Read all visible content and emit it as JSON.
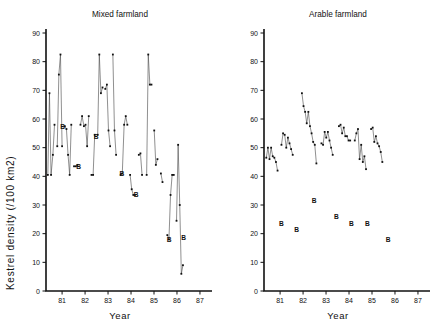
{
  "figure": {
    "y_axis_label": "Kestrel density (/100 km2)",
    "x_axis_label": "Year",
    "y_ticks": [
      "0",
      "10",
      "20",
      "30",
      "40",
      "50",
      "60",
      "70",
      "80",
      "90"
    ],
    "x_ticks": [
      "81",
      "82",
      "83",
      "84",
      "85",
      "86",
      "87"
    ],
    "b_marker_label": "B"
  },
  "panels": [
    {
      "title": "Mixed farmland"
    },
    {
      "title": "Arable farmland"
    }
  ],
  "chart_data": [
    {
      "type": "line",
      "title": "Mixed farmland",
      "xlabel": "Year",
      "ylabel": "Kestrel density (/100 km2)",
      "ylim": [
        0,
        90
      ],
      "xlim": [
        80.3,
        87.35
      ],
      "y_ticks": [
        0,
        10,
        20,
        30,
        40,
        50,
        60,
        70,
        80,
        90
      ],
      "x_ticks": [
        81,
        82,
        83,
        84,
        85,
        86,
        87
      ],
      "grid": false,
      "legend": null,
      "series": [
        {
          "name": "segment-1",
          "x": [
            80.38,
            80.45,
            80.52,
            80.6,
            80.67
          ],
          "values": [
            40.5,
            69.0,
            40.5,
            47.5,
            58.0
          ]
        },
        {
          "name": "segment-2",
          "x": [
            80.79,
            80.86,
            80.93,
            81.0
          ],
          "values": [
            50.5,
            75.5,
            82.5,
            50.5
          ]
        },
        {
          "name": "segment-3",
          "x": [
            81.12,
            81.19,
            81.26,
            81.33,
            81.4
          ],
          "values": [
            57.5,
            56.5,
            47.5,
            40.5,
            58.0
          ]
        },
        {
          "name": "segment-4",
          "x": [
            81.52,
            81.6,
            81.67
          ],
          "values": [
            43.5,
            43.5,
            44.0
          ]
        },
        {
          "name": "segment-5",
          "x": [
            81.8,
            81.87,
            81.95,
            82.02,
            82.09,
            82.16
          ],
          "values": [
            58.0,
            61.0,
            57.5,
            58.0,
            50.5,
            61.0
          ]
        },
        {
          "name": "segment-6",
          "x": [
            82.28,
            82.35,
            82.42
          ],
          "values": [
            40.5,
            40.5,
            54.5
          ]
        },
        {
          "name": "segment-7",
          "x": [
            82.55,
            82.62,
            82.69,
            82.76
          ],
          "values": [
            54.5,
            82.5,
            69.0,
            71.0
          ]
        },
        {
          "name": "segment-8",
          "x": [
            82.88,
            82.95,
            83.02,
            83.09
          ],
          "values": [
            70.5,
            72.0,
            56.0,
            50.5
          ]
        },
        {
          "name": "segment-9",
          "x": [
            83.21,
            83.28,
            83.35
          ],
          "values": [
            82.5,
            56.0,
            47.5
          ]
        },
        {
          "name": "segment-10",
          "x": [
            83.55,
            83.62,
            83.7,
            83.77,
            83.84
          ],
          "values": [
            40.5,
            41.0,
            58.0,
            61.0,
            58.0
          ]
        },
        {
          "name": "segment-11",
          "x": [
            83.96,
            84.03,
            84.1,
            84.17
          ],
          "values": [
            40.5,
            35.5,
            33.5,
            33.5
          ]
        },
        {
          "name": "segment-12",
          "x": [
            84.34,
            84.41,
            84.48
          ],
          "values": [
            47.5,
            48.0,
            40.5
          ]
        },
        {
          "name": "segment-13",
          "x": [
            84.68,
            84.75,
            84.82,
            84.89
          ],
          "values": [
            40.5,
            82.5,
            72.0,
            72.0
          ]
        },
        {
          "name": "segment-14",
          "x": [
            85.01,
            85.08,
            85.15
          ],
          "values": [
            56.0,
            44.0,
            46.0
          ]
        },
        {
          "name": "segment-15",
          "x": [
            85.3,
            85.37
          ],
          "values": [
            41.0,
            38.0
          ]
        },
        {
          "name": "segment-16",
          "x": [
            85.58,
            85.65,
            85.72,
            85.79,
            85.86
          ],
          "values": [
            19.5,
            18.0,
            33.5,
            40.5,
            40.5
          ]
        },
        {
          "name": "segment-17",
          "x": [
            85.98,
            86.05,
            86.12,
            86.19,
            86.26
          ],
          "values": [
            24.5,
            51.0,
            30.0,
            6.0,
            9.0
          ]
        }
      ],
      "b_markers": [
        {
          "x": 81.02,
          "y": 57.5
        },
        {
          "x": 81.72,
          "y": 43.5
        },
        {
          "x": 82.48,
          "y": 54.0
        },
        {
          "x": 83.6,
          "y": 41.0
        },
        {
          "x": 84.22,
          "y": 33.5
        },
        {
          "x": 85.66,
          "y": 18.0
        },
        {
          "x": 86.29,
          "y": 18.5
        }
      ]
    },
    {
      "type": "line",
      "title": "Arable farmland",
      "xlabel": "Year",
      "ylabel": "Kestrel density (/100 km2)",
      "ylim": [
        0,
        90
      ],
      "xlim": [
        80.3,
        87.35
      ],
      "y_ticks": [
        0,
        10,
        20,
        30,
        40,
        50,
        60,
        70,
        80,
        90
      ],
      "x_ticks": [
        81,
        82,
        83,
        84,
        85,
        86,
        87
      ],
      "grid": false,
      "legend": null,
      "series": [
        {
          "name": "segment-1",
          "x": [
            80.4,
            80.47,
            80.54,
            80.61,
            80.68,
            80.75,
            80.82,
            80.89
          ],
          "values": [
            46.5,
            50.0,
            46.0,
            50.0,
            47.0,
            46.5,
            45.0,
            42.0
          ]
        },
        {
          "name": "segment-2",
          "x": [
            81.06,
            81.13,
            81.2,
            81.27,
            81.34,
            81.41,
            81.48,
            81.55
          ],
          "values": [
            51.0,
            55.0,
            54.5,
            50.0,
            53.5,
            51.5,
            49.5,
            47.5
          ]
        },
        {
          "name": "segment-3",
          "x": [
            81.95,
            82.02,
            82.09,
            82.16,
            82.23,
            82.3,
            82.37,
            82.44,
            82.51,
            82.58
          ],
          "values": [
            69.0,
            64.5,
            62.5,
            58.5,
            62.5,
            57.5,
            55.0,
            52.0,
            51.0,
            44.5
          ]
        },
        {
          "name": "segment-4",
          "x": [
            82.8,
            82.87,
            82.94,
            83.01,
            83.08,
            83.15,
            83.22,
            83.29
          ],
          "values": [
            51.5,
            51.0,
            55.5,
            53.5,
            55.5,
            52.5,
            50.0,
            47.5
          ]
        },
        {
          "name": "segment-5",
          "x": [
            83.56,
            83.63,
            83.7,
            83.77,
            83.84,
            83.91,
            83.98,
            84.05
          ],
          "values": [
            57.5,
            58.0,
            55.0,
            57.0,
            54.0,
            54.0,
            52.5,
            52.5
          ]
        },
        {
          "name": "segment-6",
          "x": [
            84.25,
            84.32,
            84.39,
            84.46,
            84.53,
            84.6,
            84.67,
            84.74
          ],
          "values": [
            52.5,
            55.0,
            56.5,
            46.0,
            51.0,
            45.0,
            47.0,
            42.5
          ]
        },
        {
          "name": "segment-7",
          "x": [
            84.96,
            85.03,
            85.1,
            85.17,
            85.24,
            85.31,
            85.38,
            85.45
          ],
          "values": [
            56.5,
            57.0,
            52.0,
            54.0,
            51.5,
            50.5,
            48.5,
            45.0
          ]
        }
      ],
      "b_markers": [
        {
          "x": 81.06,
          "y": 23.5
        },
        {
          "x": 81.72,
          "y": 21.5
        },
        {
          "x": 82.48,
          "y": 31.5
        },
        {
          "x": 83.45,
          "y": 26.0
        },
        {
          "x": 84.1,
          "y": 23.5
        },
        {
          "x": 84.8,
          "y": 23.5
        },
        {
          "x": 85.7,
          "y": 18.0
        }
      ]
    }
  ]
}
